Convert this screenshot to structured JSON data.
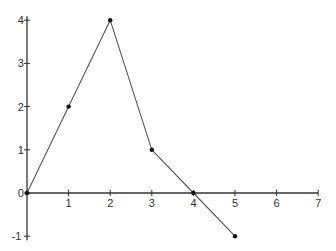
{
  "chart_data": {
    "type": "line",
    "title": "",
    "xlabel": "",
    "ylabel": "",
    "x": [
      0,
      1,
      2,
      3,
      4,
      5
    ],
    "series": [
      {
        "name": "y",
        "values": [
          0,
          2,
          4,
          1,
          0,
          -1
        ]
      }
    ],
    "x_ticks": [
      1,
      2,
      3,
      4,
      5,
      6,
      7
    ],
    "y_ticks": [
      -1,
      0,
      1,
      2,
      3,
      4
    ],
    "xlim": [
      0,
      7
    ],
    "ylim": [
      -1,
      4
    ],
    "grid": false,
    "legend": "none",
    "markers": true,
    "colors": {
      "line": "#555555",
      "axis": "#333333",
      "marker": "#111111"
    }
  }
}
